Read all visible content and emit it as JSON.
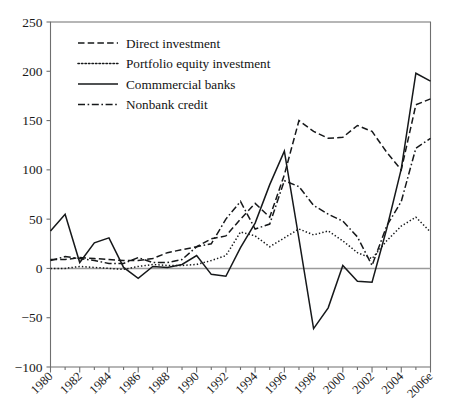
{
  "chart_data": {
    "type": "line",
    "title": "",
    "xlabel": "",
    "ylabel": "",
    "xlim": [
      1980,
      2006
    ],
    "ylim": [
      -100,
      250
    ],
    "yticks": [
      -100,
      -50,
      0,
      50,
      100,
      150,
      200,
      250
    ],
    "ytick_labels": [
      "−100",
      "−50",
      "0",
      "50",
      "100",
      "150",
      "200",
      "250"
    ],
    "grid": false,
    "zero_line": true,
    "legend_position": "top-left",
    "x": [
      1980,
      1981,
      1982,
      1983,
      1984,
      1985,
      1986,
      1987,
      1988,
      1989,
      1990,
      1991,
      1992,
      1993,
      1994,
      1995,
      1996,
      1997,
      1998,
      1999,
      2000,
      2001,
      2002,
      2003,
      2004,
      2005,
      2006
    ],
    "xtick_labels": [
      "1980",
      "1982",
      "1984",
      "1986",
      "1988",
      "1990",
      "1992",
      "1994",
      "1996",
      "1998",
      "2000",
      "2002",
      "2004",
      "2006e"
    ],
    "series": [
      {
        "name": "Direct investment",
        "style": "dashed",
        "values": [
          9,
          9,
          11,
          10,
          9,
          8,
          8,
          10,
          16,
          19,
          22,
          30,
          33,
          50,
          66,
          52,
          95,
          150,
          139,
          132,
          133,
          145,
          139,
          118,
          100,
          166,
          172
        ]
      },
      {
        "name": "Portfolio equity investment",
        "style": "dotted",
        "values": [
          0,
          0,
          2,
          1,
          0,
          -1,
          2,
          4,
          3,
          3,
          4,
          8,
          13,
          37,
          33,
          22,
          31,
          40,
          34,
          38,
          28,
          16,
          10,
          28,
          43,
          52,
          37
        ]
      },
      {
        "name": "Commmercial banks",
        "style": "solid",
        "values": [
          38,
          55,
          6,
          26,
          31,
          1,
          -10,
          2,
          1,
          4,
          13,
          -6,
          -8,
          21,
          46,
          85,
          119,
          30,
          -61,
          -40,
          3,
          -13,
          -14,
          40,
          101,
          198,
          190
        ]
      },
      {
        "name": "Nonbank credit",
        "style": "dashdot",
        "values": [
          8,
          12,
          10,
          8,
          5,
          5,
          11,
          6,
          6,
          9,
          22,
          25,
          50,
          68,
          40,
          45,
          89,
          83,
          64,
          55,
          48,
          32,
          3,
          43,
          68,
          122,
          132
        ]
      }
    ]
  },
  "legend": {
    "items": [
      {
        "label": "Direct investment",
        "style": "dashed"
      },
      {
        "label": "Portfolio equity investment",
        "style": "dotted"
      },
      {
        "label": "Commmercial banks",
        "style": "solid"
      },
      {
        "label": "Nonbank credit",
        "style": "dashdot"
      }
    ]
  }
}
